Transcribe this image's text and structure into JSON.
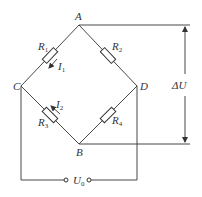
{
  "diagram": {
    "nodes": {
      "A": {
        "label": "A",
        "x": 79,
        "y": 25
      },
      "B": {
        "label": "B",
        "x": 79,
        "y": 144
      },
      "C": {
        "label": "C",
        "x": 21,
        "y": 86
      },
      "D": {
        "label": "D",
        "x": 137,
        "y": 86
      }
    },
    "resistors": [
      {
        "name": "R",
        "sub": "1",
        "branch": "A-C"
      },
      {
        "name": "R",
        "sub": "2",
        "branch": "A-D"
      },
      {
        "name": "R",
        "sub": "3",
        "branch": "C-B"
      },
      {
        "name": "R",
        "sub": "4",
        "branch": "D-B"
      }
    ],
    "currents": [
      {
        "name": "I",
        "sub": "1",
        "branch": "A-C",
        "direction": "toward C"
      },
      {
        "name": "I",
        "sub": "2",
        "branch": "B-C",
        "direction": "toward C"
      }
    ],
    "output_voltage": {
      "label": "ΔU",
      "between": "A-B"
    },
    "supply_voltage": {
      "name": "U",
      "sub": "0",
      "between": "C-D"
    }
  }
}
